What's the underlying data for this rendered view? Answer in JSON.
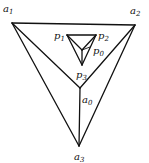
{
  "diagram": {
    "type": "geometric-construction",
    "stroke_color": "#111111",
    "outer_vertices": [
      {
        "id": "a1",
        "name": "a",
        "sub": "1",
        "x": 12,
        "y": 23,
        "lx": 3,
        "ly": 12
      },
      {
        "id": "a2",
        "name": "a",
        "sub": "2",
        "x": 135,
        "y": 25,
        "lx": 130,
        "ly": 14
      },
      {
        "id": "a3",
        "name": "a",
        "sub": "3",
        "x": 79,
        "y": 146,
        "lx": 74,
        "ly": 160
      },
      {
        "id": "a0",
        "name": "a",
        "sub": "0",
        "x": 80,
        "y": 88,
        "lx": 82,
        "ly": 103
      }
    ],
    "inner_vertices": [
      {
        "id": "p1",
        "name": "p",
        "sub": "1",
        "x": 67,
        "y": 35,
        "lx": 54,
        "ly": 39
      },
      {
        "id": "p2",
        "name": "p",
        "sub": "2",
        "x": 96,
        "y": 35,
        "lx": 98,
        "ly": 39
      },
      {
        "id": "p3",
        "name": "p",
        "sub": "3",
        "x": 82,
        "y": 65,
        "lx": 76,
        "ly": 78
      },
      {
        "id": "p0",
        "name": "p",
        "sub": "0",
        "x": 82,
        "y": 50,
        "lx": 93,
        "ly": 54
      }
    ],
    "edges": [
      [
        "a1",
        "a2"
      ],
      [
        "a1",
        "a3"
      ],
      [
        "a2",
        "a3"
      ],
      [
        "a1",
        "a0"
      ],
      [
        "a2",
        "a0"
      ],
      [
        "a3",
        "a0"
      ],
      [
        "p1",
        "p2"
      ],
      [
        "p1",
        "p3"
      ],
      [
        "p2",
        "p3"
      ],
      [
        "p1",
        "p0"
      ],
      [
        "p2",
        "p0"
      ],
      [
        "p3",
        "p0"
      ]
    ]
  }
}
